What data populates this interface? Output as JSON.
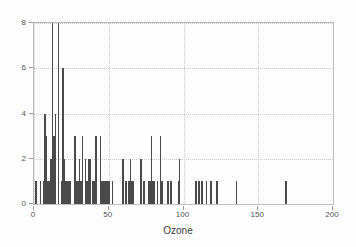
{
  "chart_data": {
    "type": "bar",
    "subtype": "histogram",
    "title": "",
    "subtitle": "",
    "xlabel": "Ozone",
    "ylabel": "",
    "xlim": [
      0,
      200
    ],
    "ylim": [
      0,
      8
    ],
    "xticks": [
      0,
      50,
      100,
      150,
      200
    ],
    "yticks": [
      0,
      2,
      4,
      6,
      8
    ],
    "grid": true,
    "grid_style": "dotted",
    "legend": null,
    "bin_width": 1,
    "bar_color": "#4a4a4a",
    "background_color": "#fdfdfd",
    "axis_color": "#b9b9b9",
    "gridline_color": "#c9c9c9",
    "tick_label_color": "#555555",
    "categories": [
      1,
      4,
      6,
      7,
      8,
      9,
      10,
      11,
      12,
      13,
      14,
      16,
      18,
      19,
      20,
      21,
      22,
      23,
      24,
      27,
      28,
      29,
      30,
      31,
      32,
      34,
      35,
      36,
      37,
      39,
      40,
      41,
      44,
      45,
      46,
      47,
      48,
      49,
      50,
      52,
      59,
      61,
      63,
      64,
      65,
      66,
      71,
      73,
      76,
      77,
      78,
      79,
      80,
      82,
      84,
      85,
      89,
      91,
      96,
      97,
      108,
      110,
      112,
      115,
      118,
      122,
      135,
      168
    ],
    "values": [
      1,
      1,
      1,
      4,
      3,
      1,
      1,
      2,
      8,
      3,
      4,
      8,
      1,
      6,
      2,
      1,
      1,
      1,
      1,
      3,
      1,
      1,
      2,
      1,
      3,
      2,
      1,
      2,
      2,
      1,
      1,
      3,
      3,
      1,
      1,
      1,
      1,
      1,
      1,
      1,
      2,
      1,
      1,
      2,
      1,
      1,
      2,
      1,
      1,
      1,
      3,
      1,
      1,
      1,
      3,
      1,
      1,
      1,
      1,
      2,
      1,
      1,
      1,
      1,
      1,
      1,
      1,
      1
    ]
  },
  "axis": {
    "x_title": "Ozone",
    "x_tick_labels": [
      "0",
      "50",
      "100",
      "150",
      "200"
    ],
    "y_tick_labels": [
      "0",
      "2",
      "4",
      "6",
      "8"
    ]
  }
}
